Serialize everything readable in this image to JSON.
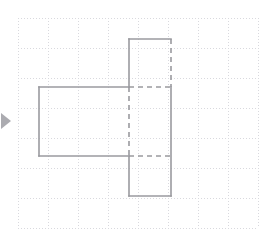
{
  "canvas": {
    "width": 273,
    "height": 241,
    "background": "#ffffff",
    "title": "Composite rectilinear figure on dotted grid paper"
  },
  "grid": {
    "type": "dotted-graph-paper",
    "origin_x": 18,
    "origin_y": 18,
    "cell_size": 30,
    "columns": 8,
    "rows": 7,
    "line_color": "#d9d9de",
    "line_width": 1,
    "dash_pattern": "1 2",
    "label": "grid"
  },
  "figure": {
    "name": "net-of-solid",
    "stroke_color": "#9a9a9f",
    "stroke_width": 1.6,
    "fill": "none",
    "dashed_pattern": "5 4",
    "solid_edges": [
      {
        "name": "top-rect-top-edge",
        "x1": 129,
        "y1": 39,
        "x2": 171,
        "y2": 39
      },
      {
        "name": "top-rect-left-edge",
        "x1": 129,
        "y1": 39,
        "x2": 129,
        "y2": 87
      },
      {
        "name": "left-rect-top-edge",
        "x1": 39,
        "y1": 87,
        "x2": 129,
        "y2": 87
      },
      {
        "name": "left-rect-left-edge",
        "x1": 39,
        "y1": 87,
        "x2": 39,
        "y2": 156
      },
      {
        "name": "left-rect-bottom-edge",
        "x1": 39,
        "y1": 156,
        "x2": 129,
        "y2": 156
      },
      {
        "name": "bottom-rect-left-edge",
        "x1": 129,
        "y1": 156,
        "x2": 129,
        "y2": 196
      },
      {
        "name": "bottom-rect-bottom-edge",
        "x1": 129,
        "y1": 196,
        "x2": 171,
        "y2": 196
      },
      {
        "name": "right-column-right-edge",
        "x1": 171,
        "y1": 87,
        "x2": 171,
        "y2": 196
      }
    ],
    "dashed_edges": [
      {
        "name": "top-rect-right-edge-hidden",
        "x1": 171,
        "y1": 39,
        "x2": 171,
        "y2": 87
      },
      {
        "name": "upper-fold-line-hidden",
        "x1": 129,
        "y1": 87,
        "x2": 171,
        "y2": 87
      },
      {
        "name": "center-vertical-fold-hidden",
        "x1": 129,
        "y1": 87,
        "x2": 129,
        "y2": 156
      },
      {
        "name": "lower-fold-line-hidden",
        "x1": 129,
        "y1": 156,
        "x2": 171,
        "y2": 156
      }
    ]
  },
  "marker": {
    "name": "left-edge-arrow",
    "shape": "right-pointing-triangle",
    "color": "#8f8f95",
    "x": 1,
    "y": 113,
    "width": 10,
    "height": 16
  }
}
